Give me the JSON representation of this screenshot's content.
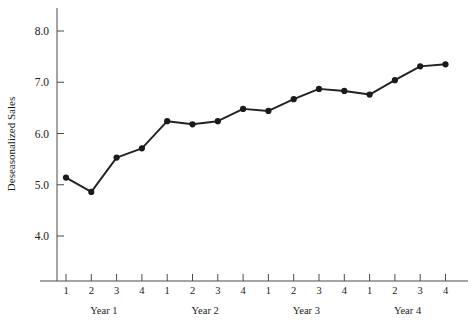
{
  "chart_data": {
    "type": "line",
    "title": "",
    "xlabel": "",
    "ylabel": "Deseasonalized Sales",
    "ylim": [
      3.55,
      8.35
    ],
    "yticks": [
      4.0,
      5.0,
      6.0,
      7.0,
      8.0
    ],
    "ytick_labels": [
      "4.0",
      "5.0",
      "6.0",
      "7.0",
      "8.0"
    ],
    "grid": false,
    "legend": "none",
    "x": [
      1,
      2,
      3,
      4,
      5,
      6,
      7,
      8,
      9,
      10,
      11,
      12,
      13,
      14,
      15,
      16
    ],
    "categories": [
      "1",
      "2",
      "3",
      "4",
      "1",
      "2",
      "3",
      "4",
      "1",
      "2",
      "3",
      "4",
      "1",
      "2",
      "3",
      "4"
    ],
    "group_labels": [
      "Year 1",
      "Year 2",
      "Year 3",
      "Year 4"
    ],
    "group_size": 4,
    "series": [
      {
        "name": "Deseasonalized Sales",
        "values": [
          5.14,
          4.86,
          5.53,
          5.71,
          6.24,
          6.18,
          6.24,
          6.48,
          6.44,
          6.67,
          6.87,
          6.83,
          6.76,
          7.04,
          7.31,
          7.35
        ],
        "marker": "circle",
        "color": "#1a1a1a"
      }
    ]
  },
  "axis": {
    "y_title": "Deseasonalized Sales"
  }
}
